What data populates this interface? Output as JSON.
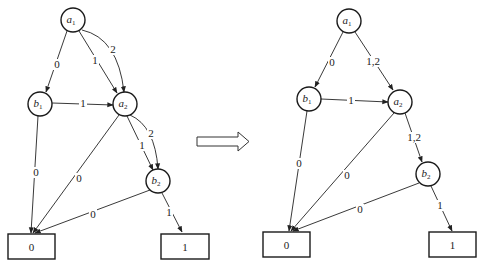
{
  "diagram": {
    "colors": {
      "stroke": "#1a1a1a",
      "background": "#ffffff"
    },
    "left": {
      "nodes": {
        "a1": {
          "var": "a",
          "sub": "1"
        },
        "b1": {
          "var": "b",
          "sub": "1"
        },
        "a2": {
          "var": "a",
          "sub": "2"
        },
        "b2": {
          "var": "b",
          "sub": "2"
        }
      },
      "leaves": {
        "zero": "0",
        "one": "1"
      },
      "edges": {
        "a1_b1": "0",
        "a1_a2_1": "1",
        "a1_a2_2": "2",
        "b1_a2": "1",
        "b1_zero": "0",
        "a2_zero": "0",
        "a2_b2_1": "1",
        "a2_b2_2": "2",
        "b2_zero": "0",
        "b2_one": "1"
      }
    },
    "right": {
      "nodes": {
        "a1": {
          "var": "a",
          "sub": "1"
        },
        "b1": {
          "var": "b",
          "sub": "1"
        },
        "a2": {
          "var": "a",
          "sub": "2"
        },
        "b2": {
          "var": "b",
          "sub": "2"
        }
      },
      "leaves": {
        "zero": "0",
        "one": "1"
      },
      "edges": {
        "a1_b1": "0",
        "a1_a2": "1,2",
        "b1_a2": "1",
        "b1_zero": "0",
        "a2_zero": "0",
        "a2_b2": "1,2",
        "b2_zero": "0",
        "b2_one": "1"
      }
    },
    "transform_arrow": "double-outline-right-arrow"
  }
}
